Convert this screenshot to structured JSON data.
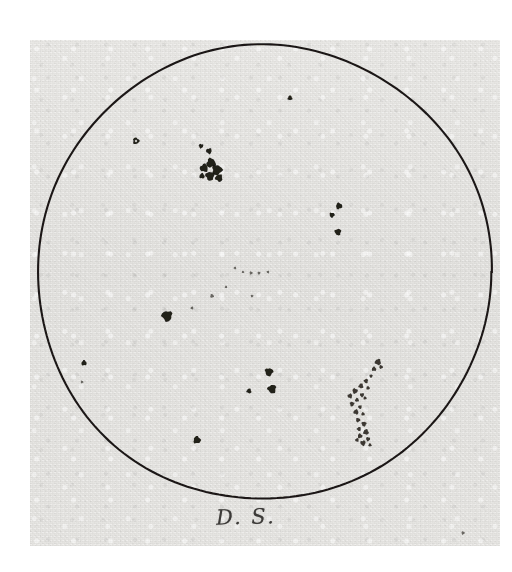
{
  "document": {
    "kind": "hand-drawn solar disc sunspot observation sketch",
    "medium": "ink on paper, photographic reproduction",
    "signature": "D. S.",
    "signature_icon": "handwritten-initials"
  },
  "paper": {
    "background_color": "#e4e3e0",
    "scan_border_color": "#ffffff",
    "left": 30,
    "top": 40,
    "width": 470,
    "height": 506
  },
  "disc": {
    "label": "solar-disc-outline",
    "center_x": 264,
    "center_y": 272,
    "radius": 227,
    "stroke_color": "#1b1917",
    "stroke_width": 2.1
  },
  "chart_data": {
    "type": "scatter",
    "title": "",
    "xlabel": "",
    "ylabel": "",
    "grid": false,
    "legend": "none",
    "xlim": [
      37,
      491
    ],
    "ylim": [
      45,
      499
    ],
    "series": [
      {
        "name": "sunspots",
        "points": [
          {
            "id": "s01",
            "x": 290,
            "y": 98,
            "r": 2.3,
            "kind": "dot"
          },
          {
            "id": "s02",
            "x": 136,
            "y": 141,
            "r": 3.2,
            "kind": "ring"
          },
          {
            "id": "s03",
            "x": 201,
            "y": 146,
            "r": 2.2,
            "kind": "dot"
          },
          {
            "id": "s04",
            "x": 209,
            "y": 151,
            "r": 2.8,
            "kind": "dot"
          },
          {
            "id": "s05",
            "x": 204,
            "y": 168,
            "r": 4.0,
            "kind": "dot"
          },
          {
            "id": "s06",
            "x": 211,
            "y": 163,
            "r": 4.6,
            "kind": "dot"
          },
          {
            "id": "s07",
            "x": 217,
            "y": 170,
            "r": 5.0,
            "kind": "dot"
          },
          {
            "id": "s08",
            "x": 210,
            "y": 176,
            "r": 4.4,
            "kind": "dot"
          },
          {
            "id": "s09",
            "x": 219,
            "y": 178,
            "r": 3.6,
            "kind": "dot"
          },
          {
            "id": "s10",
            "x": 202,
            "y": 176,
            "r": 2.6,
            "kind": "dot"
          },
          {
            "id": "s11",
            "x": 339,
            "y": 206,
            "r": 3.1,
            "kind": "dot"
          },
          {
            "id": "s12",
            "x": 332,
            "y": 215,
            "r": 2.5,
            "kind": "dot"
          },
          {
            "id": "s13",
            "x": 338,
            "y": 232,
            "r": 3.2,
            "kind": "dot"
          },
          {
            "id": "s14",
            "x": 235,
            "y": 268,
            "r": 1.3,
            "kind": "speck"
          },
          {
            "id": "s15",
            "x": 243,
            "y": 272,
            "r": 1.2,
            "kind": "speck"
          },
          {
            "id": "s16",
            "x": 251,
            "y": 273,
            "r": 1.5,
            "kind": "speck"
          },
          {
            "id": "s17",
            "x": 259,
            "y": 273,
            "r": 1.4,
            "kind": "speck"
          },
          {
            "id": "s18",
            "x": 268,
            "y": 272,
            "r": 1.3,
            "kind": "speck"
          },
          {
            "id": "s19",
            "x": 226,
            "y": 287,
            "r": 1.2,
            "kind": "speck"
          },
          {
            "id": "s20",
            "x": 212,
            "y": 296,
            "r": 1.8,
            "kind": "speck"
          },
          {
            "id": "s21",
            "x": 252,
            "y": 296,
            "r": 1.3,
            "kind": "speck"
          },
          {
            "id": "s22",
            "x": 167,
            "y": 316,
            "r": 5.2,
            "kind": "dot"
          },
          {
            "id": "s23",
            "x": 192,
            "y": 308,
            "r": 1.4,
            "kind": "speck"
          },
          {
            "id": "s24",
            "x": 84,
            "y": 363,
            "r": 2.6,
            "kind": "dot"
          },
          {
            "id": "s25",
            "x": 82,
            "y": 382,
            "r": 1.3,
            "kind": "speck"
          },
          {
            "id": "s26",
            "x": 269,
            "y": 372,
            "r": 4.0,
            "kind": "dot"
          },
          {
            "id": "s27",
            "x": 272,
            "y": 389,
            "r": 4.2,
            "kind": "dot"
          },
          {
            "id": "s28",
            "x": 249,
            "y": 391,
            "r": 2.4,
            "kind": "dot"
          },
          {
            "id": "s29",
            "x": 197,
            "y": 440,
            "r": 3.6,
            "kind": "dot"
          },
          {
            "id": "s30",
            "x": 463,
            "y": 533,
            "r": 1.6,
            "kind": "speck"
          }
        ]
      },
      {
        "name": "large-spot-group-right",
        "description": "elongated stippled sunspot chain near the SE limb",
        "points": [
          {
            "id": "g01",
            "x": 378,
            "y": 362,
            "r": 3.0,
            "kind": "stipple"
          },
          {
            "id": "g02",
            "x": 374,
            "y": 369,
            "r": 2.2,
            "kind": "stipple"
          },
          {
            "id": "g03",
            "x": 381,
            "y": 367,
            "r": 1.8,
            "kind": "stipple"
          },
          {
            "id": "g04",
            "x": 371,
            "y": 376,
            "r": 1.6,
            "kind": "stipple"
          },
          {
            "id": "g05",
            "x": 366,
            "y": 381,
            "r": 2.1,
            "kind": "stipple"
          },
          {
            "id": "g06",
            "x": 361,
            "y": 386,
            "r": 2.4,
            "kind": "stipple"
          },
          {
            "id": "g07",
            "x": 368,
            "y": 388,
            "r": 1.7,
            "kind": "stipple"
          },
          {
            "id": "g08",
            "x": 355,
            "y": 391,
            "r": 2.6,
            "kind": "stipple"
          },
          {
            "id": "g09",
            "x": 362,
            "y": 395,
            "r": 2.0,
            "kind": "stipple"
          },
          {
            "id": "g10",
            "x": 350,
            "y": 396,
            "r": 2.3,
            "kind": "stipple"
          },
          {
            "id": "g11",
            "x": 357,
            "y": 400,
            "r": 1.9,
            "kind": "stipple"
          },
          {
            "id": "g12",
            "x": 365,
            "y": 398,
            "r": 1.6,
            "kind": "stipple"
          },
          {
            "id": "g13",
            "x": 352,
            "y": 404,
            "r": 2.2,
            "kind": "stipple"
          },
          {
            "id": "g14",
            "x": 360,
            "y": 407,
            "r": 1.8,
            "kind": "stipple"
          },
          {
            "id": "g15",
            "x": 356,
            "y": 412,
            "r": 2.5,
            "kind": "stipple"
          },
          {
            "id": "g16",
            "x": 363,
            "y": 414,
            "r": 1.7,
            "kind": "stipple"
          },
          {
            "id": "g17",
            "x": 358,
            "y": 420,
            "r": 2.1,
            "kind": "stipple"
          },
          {
            "id": "g18",
            "x": 364,
            "y": 424,
            "r": 2.4,
            "kind": "stipple"
          },
          {
            "id": "g19",
            "x": 359,
            "y": 429,
            "r": 2.0,
            "kind": "stipple"
          },
          {
            "id": "g20",
            "x": 366,
            "y": 432,
            "r": 2.7,
            "kind": "stipple"
          },
          {
            "id": "g21",
            "x": 360,
            "y": 436,
            "r": 2.3,
            "kind": "stipple"
          },
          {
            "id": "g22",
            "x": 368,
            "y": 439,
            "r": 2.0,
            "kind": "stipple"
          },
          {
            "id": "g23",
            "x": 363,
            "y": 443,
            "r": 2.6,
            "kind": "stipple"
          },
          {
            "id": "g24",
            "x": 357,
            "y": 440,
            "r": 1.8,
            "kind": "stipple"
          },
          {
            "id": "g25",
            "x": 370,
            "y": 445,
            "r": 1.6,
            "kind": "stipple"
          }
        ]
      }
    ]
  }
}
